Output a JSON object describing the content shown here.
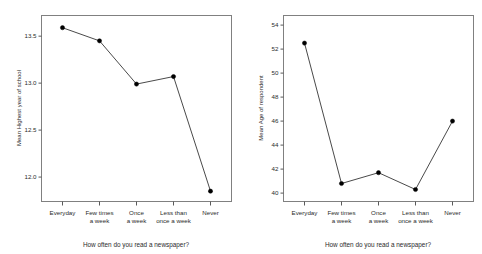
{
  "page": {
    "background": "#ffffff",
    "line_color": "#4a4a4a",
    "marker_color": "#000000",
    "frame_color": "#808080"
  },
  "chart_data": [
    {
      "type": "line",
      "id": "education-by-newspaper-readership",
      "title": "",
      "xlabel": "How often do you read a newspaper?",
      "ylabel": "Mean Highest year of school",
      "categories": [
        "Everyday",
        "Few times a week",
        "Once a week",
        "Less than once a week",
        "Never"
      ],
      "category_lines": [
        [
          "Everyday"
        ],
        [
          "Few times",
          "a week"
        ],
        [
          "Once",
          "a week"
        ],
        [
          "Less than",
          "once a week"
        ],
        [
          "Never"
        ]
      ],
      "values": [
        13.59,
        13.45,
        12.99,
        13.07,
        11.85
      ],
      "yticks": [
        "12.0",
        "12.5",
        "13.0",
        "13.5"
      ],
      "ytick_values": [
        12.0,
        12.5,
        13.0,
        13.5
      ],
      "ylim": [
        11.74,
        13.72
      ],
      "grid": false,
      "legend": "none",
      "markers": "filled-circle"
    },
    {
      "type": "line",
      "id": "age-by-newspaper-readership",
      "title": "",
      "xlabel": "How often do you read a newspaper?",
      "ylabel": "Mean Age of respondent",
      "categories": [
        "Everyday",
        "Few times a week",
        "Once a week",
        "Less than once a week",
        "Never"
      ],
      "category_lines": [
        [
          "Everyday"
        ],
        [
          "Few times",
          "a week"
        ],
        [
          "Once",
          "a week"
        ],
        [
          "Less than",
          "once a week"
        ],
        [
          "Never"
        ]
      ],
      "values": [
        52.5,
        40.8,
        41.7,
        40.3,
        46.0
      ],
      "yticks": [
        "40",
        "42",
        "44",
        "46",
        "48",
        "50",
        "52",
        "54"
      ],
      "ytick_values": [
        40,
        42,
        44,
        46,
        48,
        50,
        52,
        54
      ],
      "ylim": [
        39.3,
        54.8
      ],
      "grid": false,
      "legend": "none",
      "markers": "filled-circle"
    }
  ]
}
